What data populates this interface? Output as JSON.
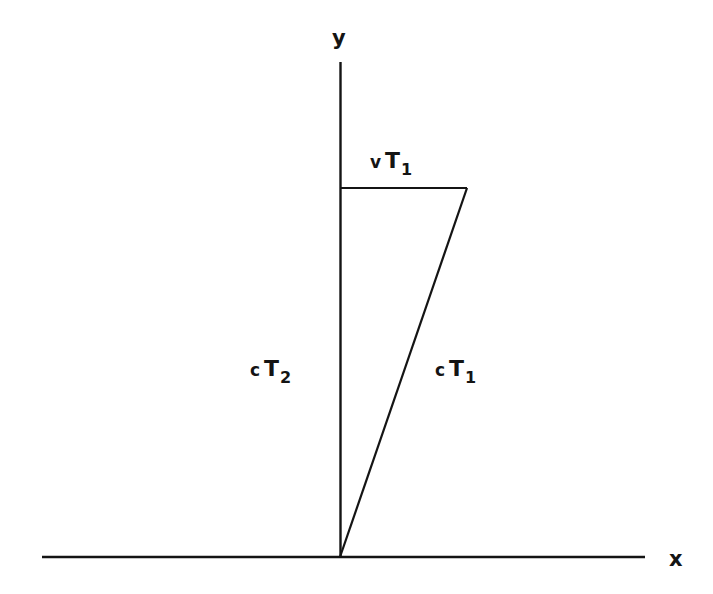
{
  "figure": {
    "background_color": "#ffffff",
    "stroke_color": "#141414",
    "width": 713,
    "height": 594
  },
  "axes": {
    "x_label": "x",
    "y_label": "y",
    "origin": {
      "x": 340,
      "y": 557
    },
    "x_axis": {
      "x1": 42,
      "y1": 557,
      "x2": 645,
      "y2": 557
    },
    "y_axis": {
      "x1": 340,
      "y1": 62,
      "x2": 340,
      "y2": 557
    }
  },
  "segments": [
    {
      "name": "horizontal-displacement",
      "label_prefix": "v",
      "label_symbol": "T",
      "label_subscript": "1",
      "x1": 341,
      "y1": 188,
      "x2": 467,
      "y2": 188
    },
    {
      "name": "light-path-moving-frame",
      "label_prefix": "c",
      "label_symbol": "T",
      "label_subscript": "1",
      "x1": 467,
      "y1": 188,
      "x2": 340,
      "y2": 557
    },
    {
      "name": "light-path-rest-frame",
      "label_prefix": "c",
      "label_symbol": "T",
      "label_subscript": "2",
      "x1": 340,
      "y1": 188,
      "x2": 340,
      "y2": 557
    }
  ],
  "labels": {
    "v_t1": {
      "prefix": "v",
      "symbol": "T",
      "subscript": "1"
    },
    "c_t2": {
      "prefix": "c",
      "symbol": "T",
      "subscript": "2"
    },
    "c_t1": {
      "prefix": "c",
      "symbol": "T",
      "subscript": "1"
    }
  }
}
